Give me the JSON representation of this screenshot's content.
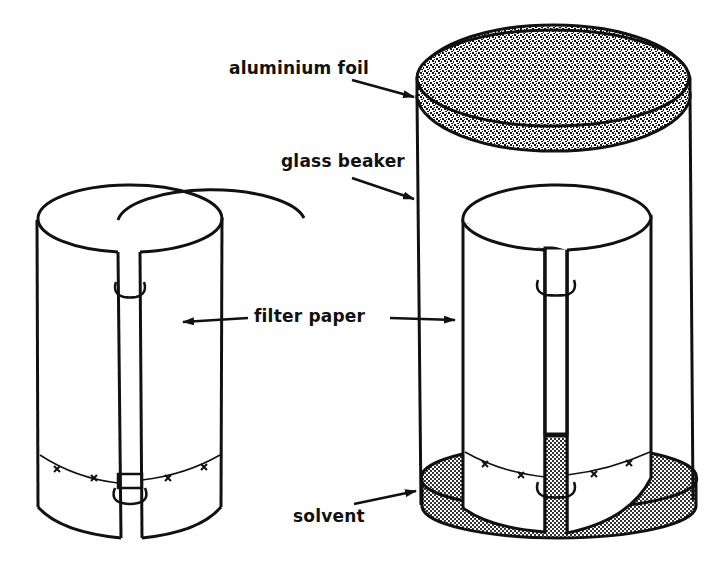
{
  "diagram": {
    "type": "apparatus-illustration",
    "colors": {
      "ink": "#111111",
      "background": "#ffffff",
      "foil_fill": "#8a8a8a",
      "solvent_fill": "#bdbdbd"
    },
    "labels": {
      "aluminium_foil": "aluminium foil",
      "glass_beaker": "glass beaker",
      "filter_paper": "filter paper",
      "solvent": "solvent"
    },
    "components": [
      {
        "id": "left-cylinder",
        "description": "Filter paper rolled into cylinder, clipped with two clips, baseline with 4 sample spots (x)"
      },
      {
        "id": "beaker",
        "description": "Glass beaker covered with aluminium foil lid"
      },
      {
        "id": "inner-cylinder",
        "description": "Filter paper cylinder standing in solvent inside beaker, baseline with 4 spots (x)"
      },
      {
        "id": "solvent-layer",
        "description": "Shallow solvent pool at beaker bottom"
      }
    ],
    "sample_spot_count": 4,
    "arrows": [
      {
        "from": "aluminium_foil",
        "to": "foil-lid"
      },
      {
        "from": "glass_beaker",
        "to": "beaker-wall"
      },
      {
        "from": "filter_paper",
        "to": "left-cylinder"
      },
      {
        "from": "filter_paper",
        "to": "inner-cylinder"
      },
      {
        "from": "solvent",
        "to": "solvent-layer"
      }
    ]
  }
}
